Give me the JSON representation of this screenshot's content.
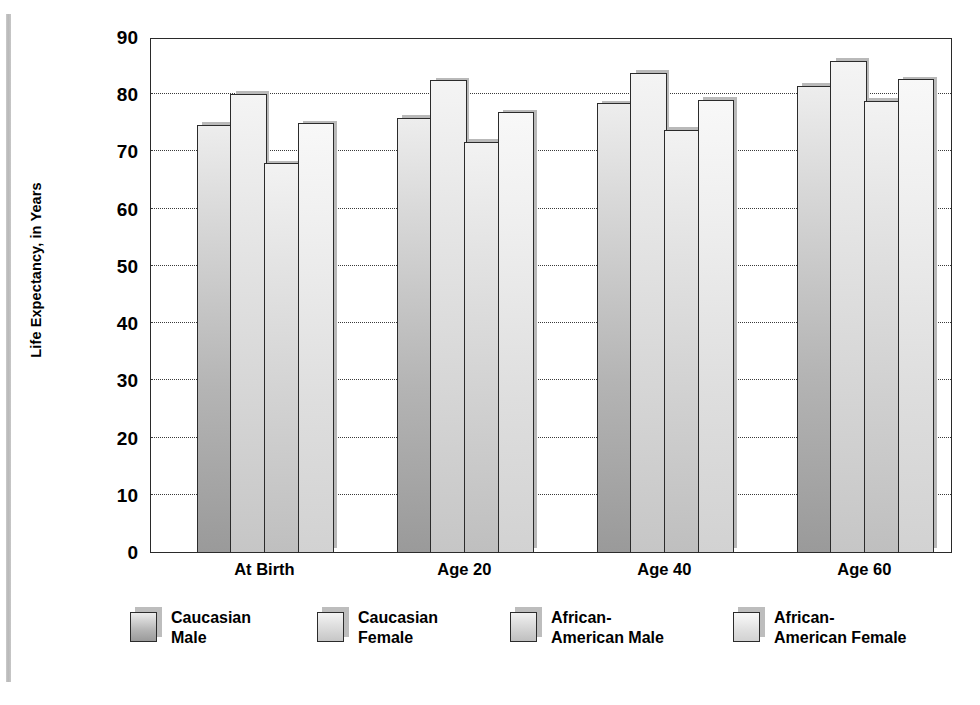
{
  "figure": {
    "y_axis_title": "Life Expectancy, in Years"
  },
  "chart_data": {
    "type": "bar",
    "title": "",
    "xlabel": "",
    "ylabel": "Life Expectancy, in Years",
    "ylim": [
      0,
      90
    ],
    "ytick_step": 10,
    "yticks": [
      90,
      80,
      70,
      60,
      50,
      40,
      30,
      20,
      10,
      0
    ],
    "grid": true,
    "grid_axis": "y",
    "grid_style": "dotted",
    "legend_position": "bottom",
    "categories": [
      "At Birth",
      "Age 20",
      "Age 40",
      "Age 60"
    ],
    "series": [
      {
        "name": "Caucasian\nMale",
        "legend_line1": "Caucasian",
        "legend_line2": "Male",
        "color": "#a8a8a8",
        "values": [
          74.4,
          75.7,
          78.2,
          81.2
        ]
      },
      {
        "name": "Caucasian\nFemale",
        "legend_line1": "Caucasian",
        "legend_line2": "Female",
        "color": "#d8d8d8",
        "values": [
          79.9,
          82.2,
          83.5,
          85.6
        ]
      },
      {
        "name": "African-\nAmerican Male",
        "legend_line1": "African-",
        "legend_line2": "American Male",
        "color": "#d2d2d2",
        "values": [
          67.7,
          71.4,
          73.6,
          78.6
        ]
      },
      {
        "name": "African-\nAmerican Female",
        "legend_line1": "African-",
        "legend_line2": "American Female",
        "color": "#e2e2e2",
        "values": [
          74.7,
          76.6,
          78.8,
          82.4
        ]
      }
    ]
  }
}
